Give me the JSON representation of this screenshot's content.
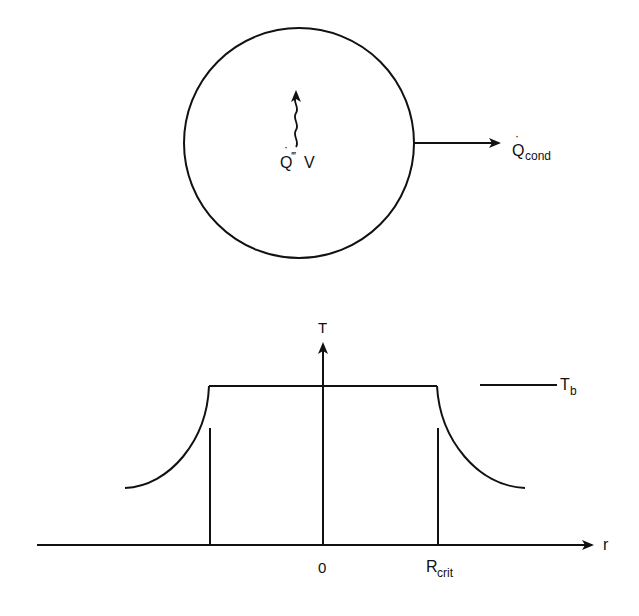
{
  "top_figure": {
    "description": "Sphere with internal heat generation conducting heat outward",
    "internal_generation_label": {
      "base": "Q",
      "dot": "·",
      "sup": "‴",
      "tail": "V"
    },
    "conduction_label": {
      "base": "Q",
      "dot": "·",
      "sub": "cond"
    }
  },
  "bottom_figure": {
    "y_axis_label": "T",
    "x_axis_label": "r",
    "bulk_temperature_label": {
      "base": "T",
      "sub": "b"
    },
    "x_ticks": [
      {
        "label": "0"
      },
      {
        "label": "R",
        "sub": "crit"
      }
    ]
  },
  "colors": {
    "ink": "#111111",
    "background": "#ffffff"
  }
}
